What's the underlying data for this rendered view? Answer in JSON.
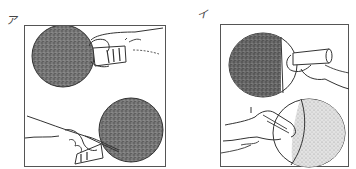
{
  "figure": {
    "top_text": "",
    "panels": [
      {
        "id": "a",
        "label": "ア",
        "description": "Shakehand grip: forehand side (top) and backhand side with index finger on rubber (bottom)"
      },
      {
        "id": "b",
        "label": "イ",
        "description": "Penhold grip: front side (top) and back side with fingers curled (bottom)"
      }
    ],
    "colors": {
      "line": "#333333",
      "rubber_dark": "#6a6a6a",
      "rubber_light": "#b8b8b8",
      "background": "#ffffff"
    }
  }
}
